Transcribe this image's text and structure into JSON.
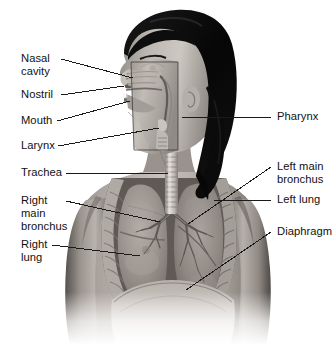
{
  "figure": {
    "background_color": "#ffffff",
    "width": 336,
    "height": 345,
    "rendering": "grayscale photographic illustration of a woman's head and upper torso, sagittal cutaway of the head and an opened chest showing the lungs"
  },
  "labels": {
    "nasal_cavity": "Nasal\ncavity",
    "nostril": "Nostril",
    "mouth": "Mouth",
    "larynx": "Larynx",
    "trachea": "Trachea",
    "right_main_bronchus": "Right\nmain\nbronchus",
    "right_lung": "Right\nlung",
    "pharynx": "Pharynx",
    "left_main_bronchus": "Left main\nbronchus",
    "left_lung": "Left lung",
    "diaphragm": "Diaphragm"
  },
  "colors": {
    "text": "#111111",
    "leader_line": "#1a1a1a",
    "background": "#ffffff",
    "hair_dark": "#090909",
    "skin_mid": "#a8a19b",
    "skin_light": "#cbc5bf",
    "lung_tissue": "#9c958f",
    "cartilage_light": "#d6d2cd",
    "rib_light": "#bdb7b1",
    "shadow": "#4a4643"
  }
}
